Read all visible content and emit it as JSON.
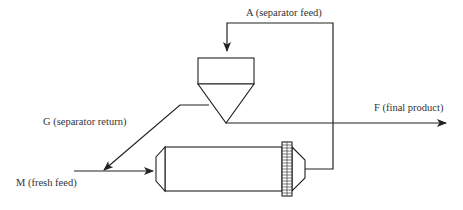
{
  "diagram": {
    "type": "process-flow",
    "labels": {
      "separator_feed": "A (separator feed)",
      "separator_return": "G (separator return)",
      "final_product": "F (final product)",
      "fresh_feed": "M (fresh feed)"
    },
    "colors": {
      "line": "#222222",
      "text": "#333333",
      "background": "#ffffff"
    },
    "components": [
      {
        "id": "separator",
        "shape": "cyclone (box with cone)"
      },
      {
        "id": "mill",
        "shape": "horizontal cylinder with gear ring"
      }
    ],
    "streams": [
      {
        "id": "M",
        "from": "outside",
        "to": "mill"
      },
      {
        "id": "A",
        "from": "mill",
        "to": "separator"
      },
      {
        "id": "G",
        "from": "separator",
        "to": "mill-feed"
      },
      {
        "id": "F",
        "from": "separator",
        "to": "outside"
      }
    ]
  }
}
